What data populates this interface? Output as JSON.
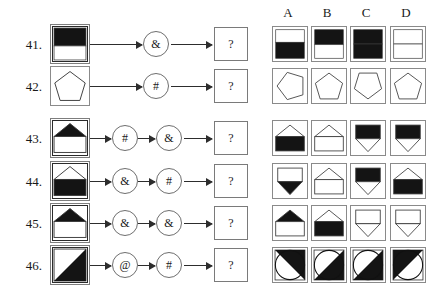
{
  "page": {
    "type": "abstract-reasoning-operator-puzzle",
    "background": "#ffffff",
    "ink": "#1a1a1a"
  },
  "options_header": {
    "letters": [
      "A",
      "B",
      "C",
      "D"
    ]
  },
  "operators": {
    "and": "&",
    "hash": "#",
    "at": "@",
    "question": "?"
  },
  "rows": [
    {
      "number": "41.",
      "input": {
        "name": "square-black-top-white-bottom",
        "frame": "double",
        "shape": "split-horizontal",
        "top_fill": "#141414",
        "bottom_fill": "#ffffff",
        "split_ratio": 0.55
      },
      "operators": [
        "&"
      ],
      "result": "?",
      "options": [
        {
          "letter": "A",
          "name": "square-white-top-black-bottom",
          "shape": "split-horizontal",
          "top_fill": "#ffffff",
          "bottom_fill": "#141414",
          "split_ratio": 0.45
        },
        {
          "letter": "B",
          "name": "square-black-top-white-bottom",
          "shape": "split-horizontal",
          "top_fill": "#141414",
          "bottom_fill": "#ffffff",
          "split_ratio": 0.52
        },
        {
          "letter": "C",
          "name": "square-all-black",
          "shape": "solid",
          "top_fill": "#141414",
          "bottom_fill": "#141414",
          "split_ratio": 0.5
        },
        {
          "letter": "D",
          "name": "square-all-white-with-divider",
          "shape": "split-horizontal",
          "top_fill": "#ffffff",
          "bottom_fill": "#ffffff",
          "split_ratio": 0.5
        }
      ]
    },
    {
      "number": "42.",
      "input": {
        "name": "pentagon-outline-upright",
        "frame": "single",
        "shape": "pentagon-up",
        "top_fill": "#ffffff",
        "bottom_fill": "#ffffff",
        "split_ratio": 0.5
      },
      "operators": [
        "#"
      ],
      "result": "?",
      "options": [
        {
          "letter": "A",
          "name": "pentagon-rotated-left",
          "shape": "pentagon-left",
          "top_fill": "#ffffff",
          "bottom_fill": "#ffffff",
          "split_ratio": 0.5
        },
        {
          "letter": "B",
          "name": "pentagon-outline-upright",
          "shape": "pentagon-up",
          "top_fill": "#ffffff",
          "bottom_fill": "#ffffff",
          "split_ratio": 0.5
        },
        {
          "letter": "C",
          "name": "pentagon-outline-inverted",
          "shape": "pentagon-down",
          "top_fill": "#ffffff",
          "bottom_fill": "#ffffff",
          "split_ratio": 0.5
        },
        {
          "letter": "D",
          "name": "pentagon-outline-upright",
          "shape": "pentagon-up",
          "top_fill": "#ffffff",
          "bottom_fill": "#ffffff",
          "split_ratio": 0.5
        }
      ]
    },
    {
      "number": "43.",
      "input": {
        "name": "house-black-roof-white-base",
        "frame": "double",
        "shape": "house-up",
        "roof_fill": "#141414",
        "base_fill": "#ffffff"
      },
      "operators": [
        "#",
        "&"
      ],
      "result": "?",
      "options": [
        {
          "letter": "A",
          "name": "house-white-roof-black-base",
          "shape": "house-up",
          "roof_fill": "#ffffff",
          "base_fill": "#141414"
        },
        {
          "letter": "B",
          "name": "house-white-roof-white-base",
          "shape": "house-up",
          "roof_fill": "#ffffff",
          "base_fill": "#ffffff"
        },
        {
          "letter": "C",
          "name": "house-inverted-black-point-white-body",
          "shape": "house-down",
          "roof_fill": "#141414",
          "base_fill": "#ffffff"
        },
        {
          "letter": "D",
          "name": "house-inverted-black-body-white-point",
          "shape": "house-down",
          "roof_fill": "#141414",
          "base_fill": "#ffffff"
        }
      ]
    },
    {
      "number": "44.",
      "input": {
        "name": "house-white-roof-black-base",
        "frame": "double",
        "shape": "house-up",
        "roof_fill": "#ffffff",
        "base_fill": "#141414"
      },
      "operators": [
        "&",
        "#"
      ],
      "result": "?",
      "options": [
        {
          "letter": "A",
          "name": "house-inverted-black-point",
          "shape": "house-down",
          "roof_fill": "#ffffff",
          "base_fill": "#141414"
        },
        {
          "letter": "B",
          "name": "house-white-roof-white-base",
          "shape": "house-up",
          "roof_fill": "#ffffff",
          "base_fill": "#ffffff"
        },
        {
          "letter": "C",
          "name": "house-inverted-black-body-striped",
          "shape": "house-down",
          "roof_fill": "#141414",
          "base_fill": "#ffffff"
        },
        {
          "letter": "D",
          "name": "house-white-roof-black-base",
          "shape": "house-up",
          "roof_fill": "#ffffff",
          "base_fill": "#141414"
        }
      ]
    },
    {
      "number": "45.",
      "input": {
        "name": "house-black-roof-white-base",
        "frame": "double",
        "shape": "house-up",
        "roof_fill": "#141414",
        "base_fill": "#ffffff"
      },
      "operators": [
        "&",
        "&"
      ],
      "result": "?",
      "options": [
        {
          "letter": "A",
          "name": "house-black-roof-white-base",
          "shape": "house-up",
          "roof_fill": "#141414",
          "base_fill": "#ffffff"
        },
        {
          "letter": "B",
          "name": "house-white-roof-black-base",
          "shape": "house-up",
          "roof_fill": "#ffffff",
          "base_fill": "#141414"
        },
        {
          "letter": "C",
          "name": "house-inverted-outline",
          "shape": "house-down",
          "roof_fill": "#ffffff",
          "base_fill": "#ffffff"
        },
        {
          "letter": "D",
          "name": "house-inverted-outline",
          "shape": "house-down",
          "roof_fill": "#ffffff",
          "base_fill": "#ffffff"
        }
      ]
    },
    {
      "number": "46.",
      "input": {
        "name": "square-diagonal-black-lower-right",
        "frame": "double",
        "shape": "diagonal",
        "diagonal_dir": "lower-right",
        "fill": "#141414"
      },
      "operators": [
        "@",
        "#"
      ],
      "result": "?",
      "options": [
        {
          "letter": "A",
          "name": "circle-diagonal-black-upper-right",
          "shape": "circle-diagonal",
          "diagonal_dir": "upper-right",
          "fill": "#141414"
        },
        {
          "letter": "B",
          "name": "circle-diagonal-black-lower-right",
          "shape": "circle-diagonal",
          "diagonal_dir": "lower-right",
          "fill": "#141414"
        },
        {
          "letter": "C",
          "name": "circle-diagonal-black-lower-right",
          "shape": "circle-diagonal",
          "diagonal_dir": "lower-right",
          "fill": "#141414"
        },
        {
          "letter": "D",
          "name": "circle-diagonal-black-upper-left",
          "shape": "circle-diagonal",
          "diagonal_dir": "upper-left",
          "fill": "#141414"
        }
      ]
    }
  ]
}
